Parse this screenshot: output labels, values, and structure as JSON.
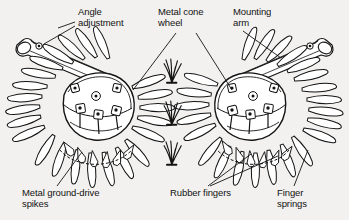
{
  "figure": {
    "background_color": "#f2f1ef",
    "ink_color": "#141414",
    "width": 349,
    "height": 220
  },
  "labels": {
    "angle_adjustment": "Angle\nadjustment",
    "metal_cone_wheel": "Metal cone\nwheel",
    "mounting_arm": "Mounting\narm",
    "metal_ground_drive_spikes": "Metal ground-drive\nspikes",
    "rubber_fingers": "Rubber fingers",
    "finger_springs": "Finger\nsprings"
  },
  "parts": [
    {
      "id": "angle-adjustment",
      "label": "Angle adjustment",
      "callout": "double-leader-left",
      "target": "arm pivot clamps"
    },
    {
      "id": "metal-cone-wheel",
      "label": "Metal cone wheel",
      "callout": "double-leader-down",
      "target": "central cone hubs"
    },
    {
      "id": "mounting-arm",
      "label": "Mounting arm",
      "callout": "single-leader-down",
      "target": "right upper arm"
    },
    {
      "id": "ground-drive-spikes",
      "label": "Metal ground-drive spikes",
      "callout": "single-leader-up",
      "target": "left wheel spikes"
    },
    {
      "id": "rubber-fingers",
      "label": "Rubber fingers",
      "callout": "double-leader-up",
      "target": "right wheel fingers"
    },
    {
      "id": "finger-springs",
      "label": "Finger springs",
      "callout": "single-leader-up",
      "target": "right wheel springs"
    }
  ],
  "assemblies": [
    {
      "id": "left-wheel",
      "description": "spiked cone wheel with radial rubber fingers, left side"
    },
    {
      "id": "right-wheel",
      "description": "spiked cone wheel with radial rubber fingers, right side"
    },
    {
      "id": "grass-tufts",
      "description": "three grass tufts between the wheels"
    }
  ]
}
